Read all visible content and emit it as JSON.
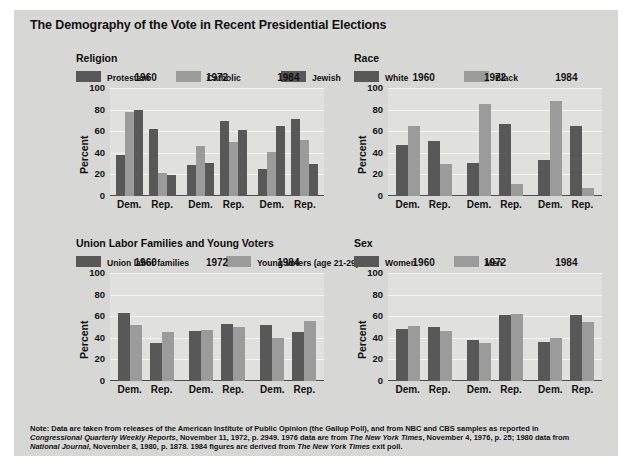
{
  "figure": {
    "title": "The Demography of the Vote in Recent Presidential Elections",
    "note": "Note: Data are taken from releases of the American Institute of Public Opinion (the Gallup Poll), and from NBC and CBS samples as reported in Congressional Quarterly Weekly Reports, November 11, 1972, p. 2949. 1976 data are from The New York Times, November 4, 1976, p. 25; 1980 data from National Journal, November 8, 1980, p. 1878. 1984 figures are derived from The New York Times exit poll.",
    "background_color": "#d7d7d5",
    "plot_background_color": "#e0e0de",
    "dark_series_color": "#585858",
    "light_series_color": "#9b9b9b"
  },
  "chart_data": [
    {
      "type": "bar",
      "title": "Religion",
      "ylabel": "Percent",
      "xlabel": "",
      "ylim": [
        0,
        100
      ],
      "yticks": [
        0,
        20,
        40,
        60,
        80,
        100
      ],
      "grid": true,
      "legend_position": "top",
      "groups": [
        "1960",
        "1972",
        "1984"
      ],
      "categories": [
        "Dem.",
        "Rep."
      ],
      "series": [
        {
          "name": "Protestant",
          "color": "#585858",
          "values": [
            [
              38,
              62
            ],
            [
              29,
              69
            ],
            [
              25,
              71
            ]
          ]
        },
        {
          "name": "Catholic",
          "color": "#9b9b9b",
          "values": [
            [
              78,
              21
            ],
            [
              46,
              50
            ],
            [
              41,
              52
            ]
          ]
        },
        {
          "name": "Jewish",
          "color": "#585858",
          "values": [
            [
              80,
              19
            ],
            [
              31,
              61
            ],
            [
              65,
              30
            ]
          ]
        }
      ]
    },
    {
      "type": "bar",
      "title": "Race",
      "ylabel": "Percent",
      "xlabel": "",
      "ylim": [
        0,
        100
      ],
      "yticks": [
        0,
        20,
        40,
        60,
        80,
        100
      ],
      "grid": true,
      "legend_position": "top",
      "groups": [
        "1960",
        "1972",
        "1984"
      ],
      "categories": [
        "Dem.",
        "Rep."
      ],
      "series": [
        {
          "name": "White",
          "color": "#585858",
          "values": [
            [
              47,
              51
            ],
            [
              31,
              67
            ],
            [
              33,
              65
            ]
          ]
        },
        {
          "name": "Black",
          "color": "#9b9b9b",
          "values": [
            [
              65,
              30
            ],
            [
              85,
              11
            ],
            [
              88,
              7
            ]
          ]
        }
      ]
    },
    {
      "type": "bar",
      "title": "Union Labor Families and Young Voters",
      "ylabel": "Percent",
      "xlabel": "",
      "ylim": [
        0,
        100
      ],
      "yticks": [
        0,
        20,
        40,
        60,
        80,
        100
      ],
      "grid": true,
      "legend_position": "top",
      "groups": [
        "1960",
        "1972",
        "1984"
      ],
      "categories": [
        "Dem.",
        "Rep."
      ],
      "series": [
        {
          "name": "Union labor families",
          "color": "#585858",
          "values": [
            [
              63,
              35
            ],
            [
              46,
              53
            ],
            [
              52,
              45
            ]
          ]
        },
        {
          "name": "Young voters (age 21-29)",
          "color": "#9b9b9b",
          "values": [
            [
              52,
              45
            ],
            [
              47,
              50
            ],
            [
              40,
              56
            ]
          ]
        }
      ]
    },
    {
      "type": "bar",
      "title": "Sex",
      "ylabel": "Percent",
      "xlabel": "",
      "ylim": [
        0,
        100
      ],
      "yticks": [
        0,
        20,
        40,
        60,
        80,
        100
      ],
      "grid": true,
      "legend_position": "top",
      "groups": [
        "1960",
        "1972",
        "1984"
      ],
      "categories": [
        "Dem.",
        "Rep."
      ],
      "series": [
        {
          "name": "Women",
          "color": "#585858",
          "values": [
            [
              48,
              50
            ],
            [
              38,
              61
            ],
            [
              36,
              61
            ]
          ]
        },
        {
          "name": "Men",
          "color": "#9b9b9b",
          "values": [
            [
              51,
              46
            ],
            [
              35,
              62
            ],
            [
              40,
              55
            ]
          ]
        }
      ]
    }
  ]
}
